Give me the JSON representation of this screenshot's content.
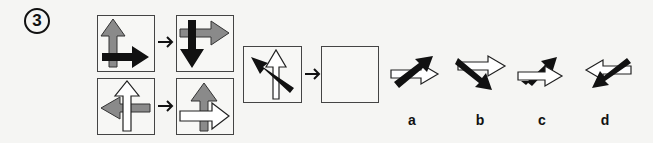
{
  "question": {
    "number": "3"
  },
  "examples": [
    {
      "before": "gray arrow up (behind), black arrow right (front)",
      "after": "gray arrow right (behind), black arrow down (front)"
    },
    {
      "before": "gray arrow left (behind), white arrow up (front)",
      "after": "gray arrow up (behind), white arrow right (front)"
    }
  ],
  "problem": {
    "given": "white arrow up (behind), black arrow up-left (front)",
    "answer_box": ""
  },
  "options": [
    {
      "label": "a",
      "description": "black arrow up-right over white arrow right"
    },
    {
      "label": "b",
      "description": "black arrow down-right over white arrow right"
    },
    {
      "label": "c",
      "description": "black arrow up-right behind white arrow right"
    },
    {
      "label": "d",
      "description": "black arrow down-left over white arrow left"
    }
  ],
  "colors": {
    "black": "#111111",
    "gray": "#8a8a8a",
    "white": "#ffffff",
    "border": "#444444"
  }
}
